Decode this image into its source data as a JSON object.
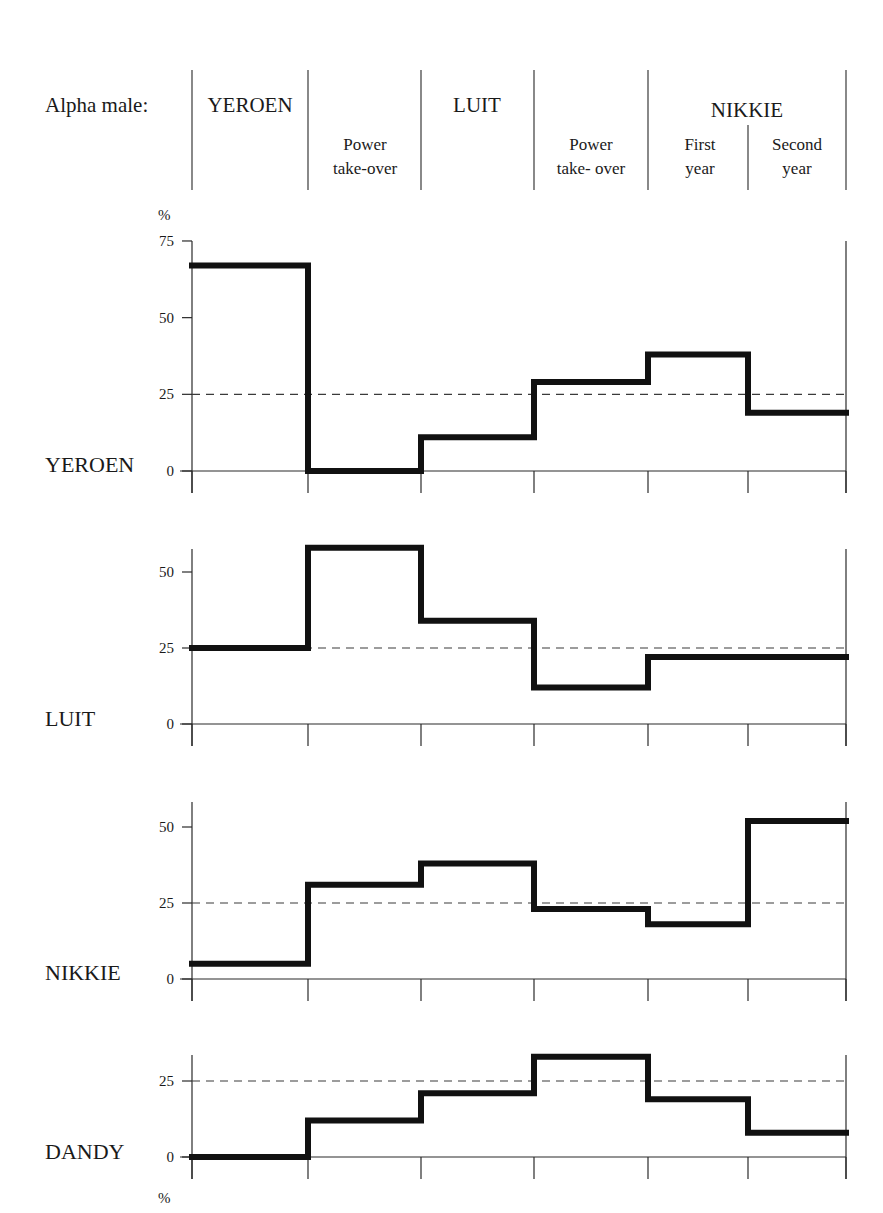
{
  "header": {
    "row_label": "Alpha male:",
    "periods": [
      {
        "alpha": "YEROEN",
        "sub": ""
      },
      {
        "alpha": "",
        "sub": "Power take-over"
      },
      {
        "alpha": "LUIT",
        "sub": ""
      },
      {
        "alpha": "",
        "sub": "Power take- over"
      },
      {
        "alpha": "NIKKIE",
        "sub": "First year"
      },
      {
        "alpha": "",
        "sub": "Second year"
      }
    ]
  },
  "units": {
    "top": "%",
    "bottom": "%"
  },
  "chart_data": {
    "type": "line",
    "subtype": "step",
    "title": "",
    "xlabel": "",
    "ylabel": "%",
    "categories": [
      "YEROEN",
      "Power take-over (Luit)",
      "LUIT",
      "Power take-over (Nikkie)",
      "NIKKIE First year",
      "NIKKIE Second year"
    ],
    "reference_line": 25,
    "reference_style": "dashed",
    "grid": false,
    "series": [
      {
        "name": "YEROEN",
        "values": [
          67,
          0,
          11,
          29,
          38,
          19
        ],
        "ylim": [
          0,
          75
        ],
        "yticks": [
          0,
          25,
          50,
          75
        ]
      },
      {
        "name": "LUIT",
        "values": [
          25,
          58,
          34,
          12,
          22,
          22
        ],
        "ylim": [
          0,
          58
        ],
        "yticks": [
          0,
          25,
          50
        ]
      },
      {
        "name": "NIKKIE",
        "values": [
          5,
          31,
          38,
          23,
          18,
          52
        ],
        "ylim": [
          0,
          58
        ],
        "yticks": [
          0,
          25,
          50
        ]
      },
      {
        "name": "DANDY",
        "values": [
          0,
          12,
          21,
          33,
          19,
          8
        ],
        "ylim": [
          0,
          33
        ],
        "yticks": [
          0,
          25
        ]
      }
    ]
  }
}
